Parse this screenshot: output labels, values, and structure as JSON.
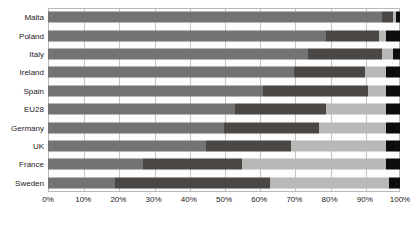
{
  "chart_data": {
    "type": "bar",
    "orientation": "horizontal",
    "stacked": true,
    "normalized": true,
    "title": "",
    "subtitle": "",
    "xlabel": "",
    "ylabel": "",
    "xlim": [
      0,
      100
    ],
    "xtick_labels": [
      "0%",
      "10%",
      "20%",
      "30%",
      "40%",
      "50%",
      "60%",
      "70%",
      "80%",
      "90%",
      "100%"
    ],
    "xtick_values": [
      0,
      10,
      20,
      30,
      40,
      50,
      60,
      70,
      80,
      90,
      100
    ],
    "grid": true,
    "grid_axis": "x",
    "legend": "none",
    "categories": [
      "Malta",
      "Poland",
      "Italy",
      "Ireland",
      "Spain",
      "EU28",
      "Germany",
      "UK",
      "France",
      "Sweden"
    ],
    "series": [
      {
        "name": "segment-1",
        "color": "#737373",
        "values": [
          95,
          79,
          74,
          70,
          61,
          53,
          50,
          45,
          27,
          19
        ]
      },
      {
        "name": "segment-2",
        "color": "#4a4745",
        "values": [
          3,
          15,
          21,
          20,
          30,
          26,
          27,
          24,
          28,
          44
        ]
      },
      {
        "name": "segment-3",
        "color": "#b8b8b6",
        "values": [
          1,
          2,
          3,
          6,
          5,
          17,
          19,
          27,
          41,
          34
        ]
      },
      {
        "name": "segment-4",
        "color": "#0d0d0d",
        "values": [
          1,
          4,
          2,
          4,
          4,
          4,
          4,
          4,
          4,
          3
        ]
      }
    ],
    "rows": [
      {
        "label": "Malta",
        "values": [
          95,
          3,
          1,
          1
        ]
      },
      {
        "label": "Poland",
        "values": [
          79,
          15,
          2,
          4
        ]
      },
      {
        "label": "Italy",
        "values": [
          74,
          21,
          3,
          2
        ]
      },
      {
        "label": "Ireland",
        "values": [
          70,
          20,
          6,
          4
        ]
      },
      {
        "label": "Spain",
        "values": [
          61,
          30,
          5,
          4
        ]
      },
      {
        "label": "EU28",
        "values": [
          53,
          26,
          17,
          4
        ]
      },
      {
        "label": "Germany",
        "values": [
          50,
          27,
          19,
          4
        ]
      },
      {
        "label": "UK",
        "values": [
          45,
          24,
          27,
          4
        ]
      },
      {
        "label": "France",
        "values": [
          27,
          28,
          41,
          4
        ]
      },
      {
        "label": "Sweden",
        "values": [
          19,
          44,
          34,
          3
        ]
      }
    ],
    "segment_colors": [
      "#737373",
      "#4a4745",
      "#b8b8b6",
      "#0d0d0d"
    ]
  }
}
